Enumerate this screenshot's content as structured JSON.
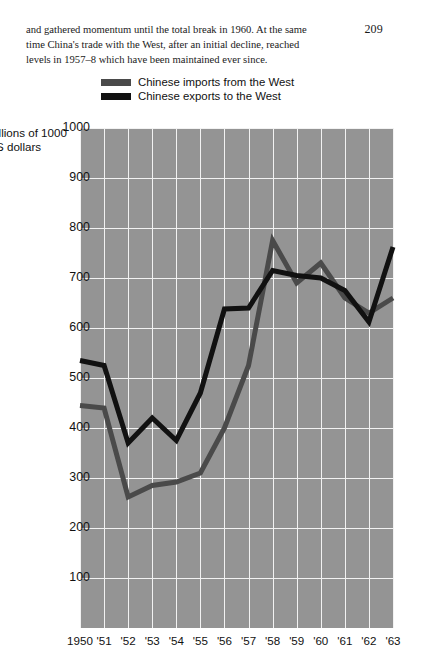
{
  "page": {
    "number": "209",
    "body_text": "and gathered momentum until the total\nbreak in 1960. At the same time China's\ntrade with the West, after an initial decline, reached\nlevels in 1957–8 which have been maintained ever since."
  },
  "colors": {
    "plot_background": "#949494",
    "gridline": "#f2f2f2",
    "imports_line": "#4a4a4a",
    "exports_line": "#111111",
    "text": "#111111",
    "page_background": "#ffffff"
  },
  "legend": {
    "position": "above-plot-left",
    "items": [
      {
        "label": "Chinese imports from the West",
        "color": "#4a4a4a",
        "swatch": "legend-swatch-imports"
      },
      {
        "label": "Chinese exports to the West",
        "color": "#111111",
        "swatch": "legend-swatch-exports"
      }
    ]
  },
  "chart_data": {
    "type": "line",
    "title": "",
    "subtitle": "",
    "xlabel": "",
    "ylabel": "Millions of\nUS dollars",
    "ylabel_visible": "illions of 1000\nS dollars",
    "grid": true,
    "legend_position": "top-left-above-plot",
    "xlim": [
      "1950",
      "1963"
    ],
    "ylim": [
      0,
      1000
    ],
    "yticks": [
      1000,
      900,
      800,
      700,
      600,
      500,
      400,
      300,
      200,
      100
    ],
    "ytick_labels": [
      "1000",
      "900",
      "800",
      "700",
      "600",
      "500",
      "400",
      "300",
      "200",
      "100"
    ],
    "x": [
      "1950",
      "1951",
      "1952",
      "1953",
      "1954",
      "1955",
      "1956",
      "1957",
      "1958",
      "1959",
      "1960",
      "1961",
      "1962",
      "1963"
    ],
    "xtick_labels": [
      "1950",
      "'51",
      "'52",
      "'53",
      "'54",
      "'55",
      "'56",
      "'57",
      "'58",
      "'59",
      "'60",
      "'61",
      "'62",
      "'63"
    ],
    "series": [
      {
        "name": "Chinese imports from the West",
        "color": "#4a4a4a",
        "values": [
          445,
          440,
          262,
          285,
          292,
          310,
          400,
          525,
          775,
          690,
          730,
          660,
          630,
          660
        ]
      },
      {
        "name": "Chinese exports to the West",
        "color": "#111111",
        "values": [
          535,
          525,
          370,
          420,
          375,
          470,
          638,
          640,
          715,
          705,
          700,
          675,
          612,
          762
        ]
      }
    ]
  }
}
